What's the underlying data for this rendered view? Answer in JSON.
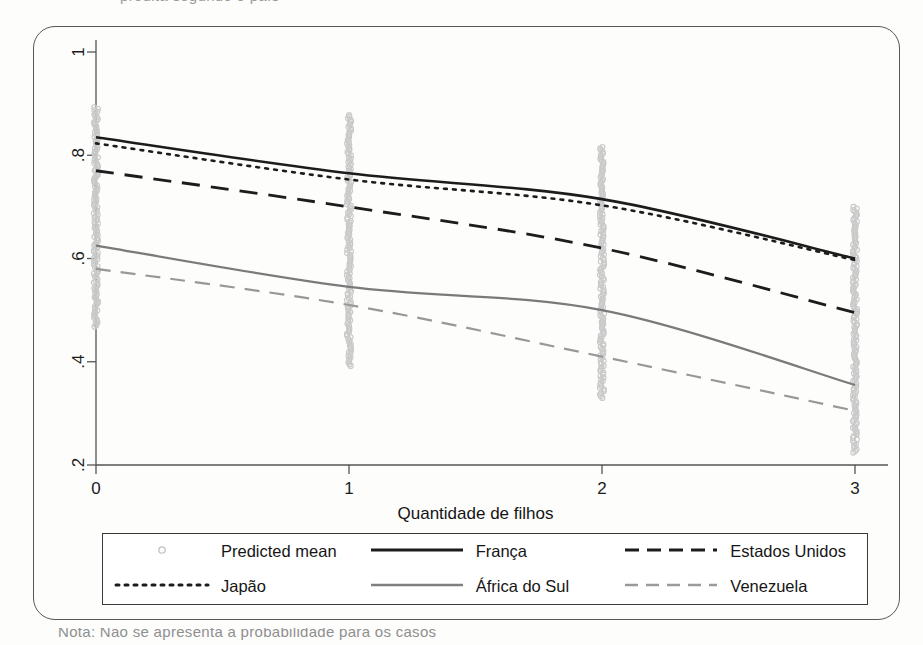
{
  "page": {
    "top_cut_text": "predita segundo o país",
    "bottom_cut_text": "Nota: Não se apresenta a probabilidade para os casos"
  },
  "chart_data": {
    "type": "line",
    "title": "",
    "xlabel": "Quantidade de filhos",
    "ylabel": "",
    "x": [
      0,
      1,
      2,
      3
    ],
    "xlim": [
      -0.15,
      3.15
    ],
    "ylim": [
      0.2,
      1.0
    ],
    "xticks": [
      "0",
      "1",
      "2",
      "3"
    ],
    "yticks": [
      ".2",
      ".4",
      ".6",
      ".8",
      "1"
    ],
    "ytick_values": [
      0.2,
      0.4,
      0.6,
      0.8,
      1.0
    ],
    "grid": false,
    "legend_position": "below-plot",
    "series": [
      {
        "name": "França",
        "style": "solid",
        "color": "#1c1c1c",
        "width": 2.6,
        "values": [
          0.835,
          0.765,
          0.715,
          0.6
        ]
      },
      {
        "name": "Japão",
        "style": "dotted",
        "color": "#1c1c1c",
        "width": 2.6,
        "values": [
          0.823,
          0.753,
          0.703,
          0.597
        ]
      },
      {
        "name": "Estados Unidos",
        "style": "dashed",
        "color": "#1c1c1c",
        "width": 2.8,
        "values": [
          0.77,
          0.7,
          0.62,
          0.495
        ]
      },
      {
        "name": "África do Sul",
        "style": "solid",
        "color": "#7a7a7a",
        "width": 2.2,
        "values": [
          0.625,
          0.545,
          0.5,
          0.355
        ]
      },
      {
        "name": "Venezuela",
        "style": "dashed",
        "color": "#989898",
        "width": 2.2,
        "values": [
          0.58,
          0.51,
          0.41,
          0.305
        ]
      }
    ],
    "scatter": {
      "name": "Predicted mean",
      "marker": "open-circle",
      "color": "#c9c9c9",
      "columns": [
        {
          "x": 0,
          "ymin": 0.468,
          "ymax": 0.893,
          "n": 150
        },
        {
          "x": 1,
          "ymin": 0.392,
          "ymax": 0.878,
          "n": 150
        },
        {
          "x": 2,
          "ymin": 0.33,
          "ymax": 0.816,
          "n": 150
        },
        {
          "x": 3,
          "ymin": 0.224,
          "ymax": 0.7,
          "n": 150
        }
      ]
    }
  },
  "legend": {
    "rows": [
      [
        {
          "key": "open-circle",
          "label": "Predicted mean"
        },
        {
          "key": "solid-black",
          "label": "França"
        },
        {
          "key": "dashed-black",
          "label": "Estados Unidos"
        }
      ],
      [
        {
          "key": "dotted-black",
          "label": "Japão"
        },
        {
          "key": "solid-gray",
          "label": "África do Sul"
        },
        {
          "key": "dashed-gray",
          "label": "Venezuela"
        }
      ]
    ]
  }
}
